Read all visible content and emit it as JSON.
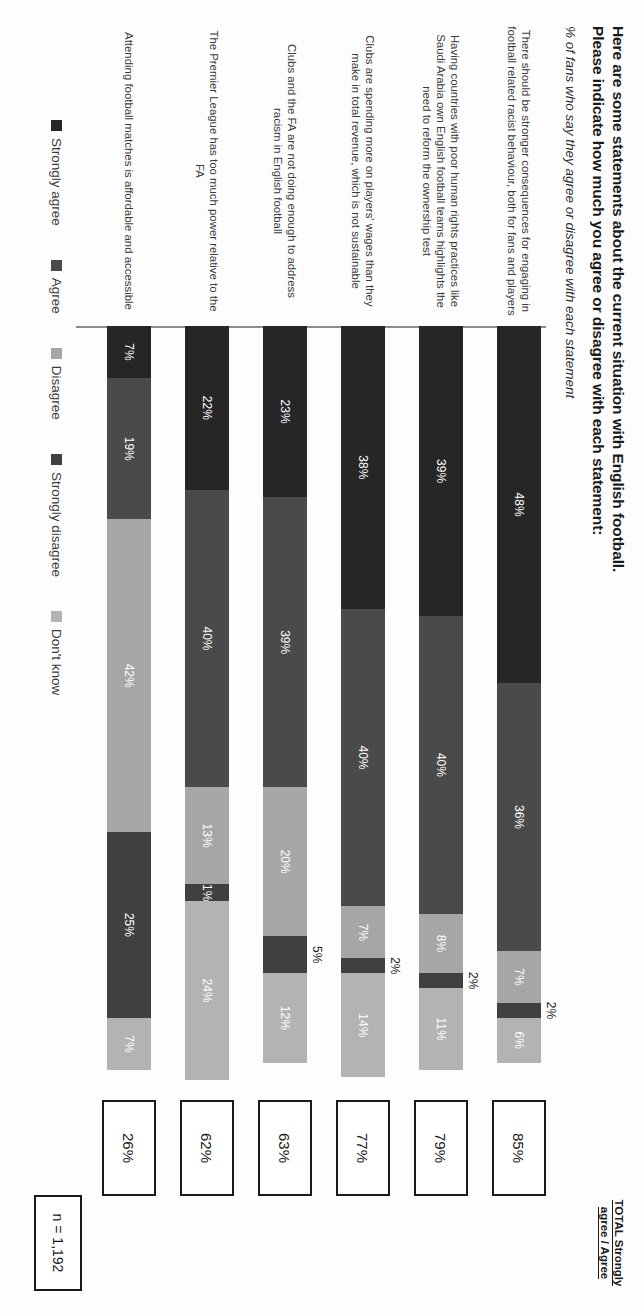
{
  "header": {
    "title_line1": "Here are some statements about the current situation with English football.",
    "title_line2": "Please indicate how much you agree or disagree with each statement:",
    "subtitle": "% of fans who say they agree or disagree with each statement",
    "total_header_line1": "TOTAL Strongly",
    "total_header_line2": "agree / Agree"
  },
  "footer": {
    "sample_size": "n = 1,192"
  },
  "legend": [
    {
      "label": "Strongly agree",
      "color": "#262626"
    },
    {
      "label": "Agree",
      "color": "#4a4a4a"
    },
    {
      "label": "Disagree",
      "color": "#a6a6a6"
    },
    {
      "label": "Strongly disagree",
      "color": "#404040"
    },
    {
      "label": "Don't know",
      "color": "#b3b3b3"
    }
  ],
  "chart_data": {
    "type": "bar",
    "subtype": "stacked-horizontal-100",
    "title": "Here are some statements about the current situation with English football. Please indicate how much you agree or disagree with each statement:",
    "subtitle": "% of fans who say they agree or disagree with each statement",
    "xlabel": "",
    "ylabel": "",
    "xlim": [
      0,
      100
    ],
    "grid": false,
    "legend_position": "bottom",
    "sample_size": "n = 1,192",
    "series": [
      {
        "name": "Strongly agree",
        "color": "#262626",
        "values": [
          48,
          39,
          38,
          23,
          22,
          7
        ]
      },
      {
        "name": "Agree",
        "color": "#4a4a4a",
        "values": [
          36,
          40,
          40,
          39,
          40,
          19
        ]
      },
      {
        "name": "Disagree",
        "color": "#a6a6a6",
        "values": [
          7,
          8,
          7,
          20,
          13,
          42
        ]
      },
      {
        "name": "Strongly disagree",
        "color": "#404040",
        "values": [
          2,
          2,
          2,
          5,
          1,
          25
        ]
      },
      {
        "name": "Don't know",
        "color": "#b3b3b3",
        "values": [
          6,
          11,
          14,
          12,
          24,
          7
        ]
      }
    ],
    "categories": [
      "There should be stronger consequences for engaging in football related racist behaviour, both for fans and players",
      "Having countries with poor human rights practices like Saudi Arabia own English football teams highlights the need to reform the ownership test",
      "Clubs are spending more on players' wages than they make in total revenue, which is not sustainable",
      "Clubs and the FA are not doing enough to address racism in English football",
      "The Premier League has too much power relative to the FA",
      "Attending football matches is affordable and accessible"
    ],
    "totals": [
      "85%",
      "79%",
      "77%",
      "63%",
      "62%",
      "26%"
    ]
  },
  "rows": [
    {
      "label": "There should be stronger consequences for engaging in football related racist behaviour, both for fans and players",
      "total": "85%",
      "segments": [
        {
          "name": "Strongly agree",
          "value": 48,
          "text": "48%",
          "color": "#262626",
          "outside": false
        },
        {
          "name": "Agree",
          "value": 36,
          "text": "36%",
          "color": "#4a4a4a",
          "outside": false
        },
        {
          "name": "Disagree",
          "value": 7,
          "text": "7%",
          "color": "#a6a6a6",
          "outside": false
        },
        {
          "name": "Strongly disagree",
          "value": 2,
          "text": "2%",
          "color": "#404040",
          "outside": true
        },
        {
          "name": "Don't know",
          "value": 6,
          "text": "6%",
          "color": "#b3b3b3",
          "outside": false
        }
      ]
    },
    {
      "label": "Having countries with poor human rights practices like Saudi Arabia own English football teams highlights the need to reform the ownership test",
      "total": "79%",
      "segments": [
        {
          "name": "Strongly agree",
          "value": 39,
          "text": "39%",
          "color": "#262626",
          "outside": false
        },
        {
          "name": "Agree",
          "value": 40,
          "text": "40%",
          "color": "#4a4a4a",
          "outside": false
        },
        {
          "name": "Disagree",
          "value": 8,
          "text": "8%",
          "color": "#a6a6a6",
          "outside": false
        },
        {
          "name": "Strongly disagree",
          "value": 2,
          "text": "2%",
          "color": "#404040",
          "outside": true
        },
        {
          "name": "Don't know",
          "value": 11,
          "text": "11%",
          "color": "#b3b3b3",
          "outside": false
        }
      ]
    },
    {
      "label": "Clubs are spending more on players' wages than they make in total revenue, which is not sustainable",
      "total": "77%",
      "segments": [
        {
          "name": "Strongly agree",
          "value": 38,
          "text": "38%",
          "color": "#262626",
          "outside": false
        },
        {
          "name": "Agree",
          "value": 40,
          "text": "40%",
          "color": "#4a4a4a",
          "outside": false
        },
        {
          "name": "Disagree",
          "value": 7,
          "text": "7%",
          "color": "#a6a6a6",
          "outside": false
        },
        {
          "name": "Strongly disagree",
          "value": 2,
          "text": "2%",
          "color": "#404040",
          "outside": true
        },
        {
          "name": "Don't know",
          "value": 14,
          "text": "14%",
          "color": "#b3b3b3",
          "outside": false
        }
      ]
    },
    {
      "label": "Clubs and the FA are not doing enough to address racism in English football",
      "total": "63%",
      "segments": [
        {
          "name": "Strongly agree",
          "value": 23,
          "text": "23%",
          "color": "#262626",
          "outside": false
        },
        {
          "name": "Agree",
          "value": 39,
          "text": "39%",
          "color": "#4a4a4a",
          "outside": false
        },
        {
          "name": "Disagree",
          "value": 20,
          "text": "20%",
          "color": "#a6a6a6",
          "outside": false
        },
        {
          "name": "Strongly disagree",
          "value": 5,
          "text": "5%",
          "color": "#404040",
          "outside": true
        },
        {
          "name": "Don't know",
          "value": 12,
          "text": "12%",
          "color": "#b3b3b3",
          "outside": false
        }
      ]
    },
    {
      "label": "The Premier League has too much power relative to the FA",
      "total": "62%",
      "segments": [
        {
          "name": "Strongly agree",
          "value": 22,
          "text": "22%",
          "color": "#262626",
          "outside": false
        },
        {
          "name": "Agree",
          "value": 40,
          "text": "40%",
          "color": "#4a4a4a",
          "outside": false
        },
        {
          "name": "Disagree",
          "value": 13,
          "text": "13%",
          "color": "#a6a6a6",
          "outside": false
        },
        {
          "name": "Strongly disagree",
          "value": 1,
          "text": "1%",
          "color": "#404040",
          "outside": false
        },
        {
          "name": "Don't know",
          "value": 24,
          "text": "24%",
          "color": "#b3b3b3",
          "outside": false
        }
      ]
    },
    {
      "label": "Attending football matches is affordable and accessible",
      "total": "26%",
      "segments": [
        {
          "name": "Strongly agree",
          "value": 7,
          "text": "7%",
          "color": "#262626",
          "outside": false
        },
        {
          "name": "Agree",
          "value": 19,
          "text": "19%",
          "color": "#4a4a4a",
          "outside": false
        },
        {
          "name": "Disagree",
          "value": 42,
          "text": "42%",
          "color": "#a6a6a6",
          "outside": false
        },
        {
          "name": "Strongly disagree",
          "value": 25,
          "text": "25%",
          "color": "#404040",
          "outside": false
        },
        {
          "name": "Don't know",
          "value": 7,
          "text": "7%",
          "color": "#b3b3b3",
          "outside": false
        }
      ]
    }
  ]
}
